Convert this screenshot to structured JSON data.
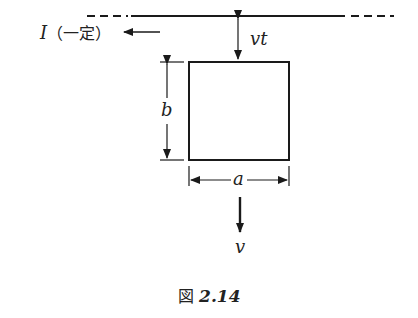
{
  "figure": {
    "current_label": "I",
    "current_note": "（一定）",
    "distance_label": "vt",
    "height_label": "b",
    "width_label": "a",
    "velocity_label": "v",
    "caption_prefix": "図",
    "caption_number": "2.14"
  },
  "colors": {
    "line": "#1a1a1a",
    "text": "#222222",
    "background": "#ffffff"
  }
}
